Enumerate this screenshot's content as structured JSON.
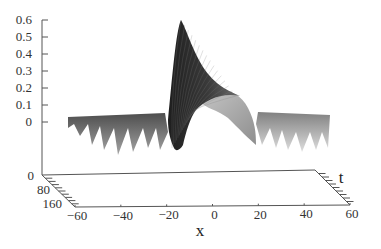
{
  "chart_data": {
    "type": "surface3d",
    "title": "",
    "xlabel": "x",
    "ylabel": "t",
    "zlabel": "",
    "x_ticks": [
      "-60",
      "-40",
      "-20",
      "0",
      "20",
      "40",
      "60"
    ],
    "t_ticks": [
      "0",
      "80",
      "160"
    ],
    "z_ticks": [
      "0",
      "0.1",
      "0.2",
      "0.3",
      "0.4",
      "0.5",
      "0.6"
    ],
    "x_range": [
      -60,
      60
    ],
    "t_range": [
      0,
      160
    ],
    "z_range": [
      0,
      0.6
    ],
    "peak": {
      "x": -10,
      "z": 0.6
    },
    "background_level": 0.0,
    "ripple_min": -0.1,
    "grid": false,
    "colors": {
      "surface_dark": "#2a2a2a",
      "surface_light": "#b5b5b5",
      "axes": "#555555"
    }
  },
  "axes": {
    "x_label": "x",
    "t_label": "t",
    "z_tick_labels": [
      "0.6",
      "0.5",
      "0.4",
      "0.3",
      "0.2",
      "0.1",
      "0"
    ],
    "x_tick_labels": [
      "-60",
      "-40",
      "-20",
      "0",
      "20",
      "40",
      "60"
    ],
    "t_tick_labels": [
      "0",
      "80",
      "160"
    ]
  }
}
